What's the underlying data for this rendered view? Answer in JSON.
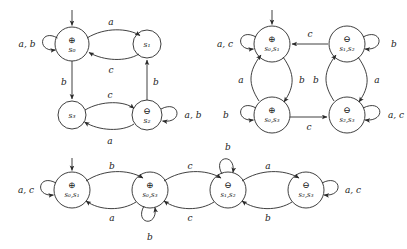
{
  "figure": {
    "type": "finite-automata-diagrams",
    "count": 3,
    "background": "#ffffff",
    "stroke": "#2a2a2a",
    "text_color": "#1a1a1a"
  },
  "symbols": {
    "accepting": "⊕",
    "rejecting": "⊖",
    "start_marker": "arrow"
  },
  "diagrams": [
    {
      "id": "dfa-1",
      "name": "automaton-top-left",
      "states": [
        {
          "id": "s0",
          "label": "s",
          "sub": "0",
          "mark": "⊕",
          "start": true,
          "cx": 72,
          "cy": 44,
          "r": 17
        },
        {
          "id": "s1",
          "label": "s",
          "sub": "1",
          "mark": "",
          "start": false,
          "cx": 147,
          "cy": 44,
          "r": 14
        },
        {
          "id": "s3",
          "label": "s",
          "sub": "3",
          "mark": "",
          "start": false,
          "cx": 72,
          "cy": 115,
          "r": 14
        },
        {
          "id": "s2",
          "label": "s",
          "sub": "2",
          "mark": "⊖",
          "start": false,
          "cx": 147,
          "cy": 115,
          "r": 15
        }
      ],
      "transitions": [
        {
          "from": "s0",
          "to": "s0",
          "label": "a, b",
          "kind": "self-left"
        },
        {
          "from": "s0",
          "to": "s1",
          "label": "a",
          "kind": "arc-top"
        },
        {
          "from": "s1",
          "to": "s0",
          "label": "c",
          "kind": "arc-bottom"
        },
        {
          "from": "s0",
          "to": "s3",
          "label": "b",
          "kind": "line-down-left"
        },
        {
          "from": "s2",
          "to": "s1",
          "label": "b",
          "kind": "line-up-right"
        },
        {
          "from": "s3",
          "to": "s2",
          "label": "c",
          "kind": "arc-top"
        },
        {
          "from": "s2",
          "to": "s3",
          "label": "a",
          "kind": "arc-bottom"
        },
        {
          "from": "s2",
          "to": "s2",
          "label": "a, b",
          "kind": "self-right"
        }
      ]
    },
    {
      "id": "dfa-2",
      "name": "automaton-top-right",
      "states": [
        {
          "id": "s0s1",
          "label": "s",
          "sub": "0",
          "label2": "s",
          "sub2": "1",
          "mark": "⊕",
          "start": true,
          "cx": 272,
          "cy": 44,
          "r": 18
        },
        {
          "id": "s1s2",
          "label": "s",
          "sub": "1",
          "label2": "s",
          "sub2": "2",
          "mark": "⊖",
          "start": false,
          "cx": 347,
          "cy": 44,
          "r": 18
        },
        {
          "id": "s0s3",
          "label": "s",
          "sub": "0",
          "label2": "s",
          "sub2": "3",
          "mark": "⊕",
          "start": false,
          "cx": 272,
          "cy": 115,
          "r": 18
        },
        {
          "id": "s2s3",
          "label": "s",
          "sub": "2",
          "label2": "s",
          "sub2": "3",
          "mark": "⊖",
          "start": false,
          "cx": 347,
          "cy": 115,
          "r": 18
        }
      ],
      "transitions": [
        {
          "from": "s0s1",
          "to": "s0s1",
          "label": "a, c",
          "kind": "self-left"
        },
        {
          "from": "s1s2",
          "to": "s0s1",
          "label": "c",
          "kind": "line-left"
        },
        {
          "from": "s1s2",
          "to": "s1s2",
          "label": "b",
          "kind": "self-right"
        },
        {
          "from": "s0s3",
          "to": "s0s1",
          "label": "a",
          "kind": "arc-left-up"
        },
        {
          "from": "s0s1",
          "to": "s0s3",
          "label": "b",
          "kind": "arc-right-down"
        },
        {
          "from": "s1s2",
          "to": "s2s3",
          "label": "a",
          "kind": "arc-right-down"
        },
        {
          "from": "s2s3",
          "to": "s1s2",
          "label": "b",
          "kind": "arc-left-up"
        },
        {
          "from": "s0s3",
          "to": "s0s3",
          "label": "b",
          "kind": "self-left"
        },
        {
          "from": "s0s3",
          "to": "s2s3",
          "label": "c",
          "kind": "line-right"
        },
        {
          "from": "s2s3",
          "to": "s2s3",
          "label": "a, c",
          "kind": "self-right"
        }
      ]
    },
    {
      "id": "dfa-3",
      "name": "automaton-bottom",
      "states": [
        {
          "id": "s0s1",
          "label": "s",
          "sub": "0",
          "label2": "s",
          "sub2": "1",
          "mark": "⊕",
          "start": true,
          "cx": 72,
          "cy": 190,
          "r": 18
        },
        {
          "id": "s0s3",
          "label": "s",
          "sub": "0",
          "label2": "s",
          "sub2": "3",
          "mark": "⊕",
          "start": false,
          "cx": 150,
          "cy": 190,
          "r": 18
        },
        {
          "id": "s1s2",
          "label": "s",
          "sub": "1",
          "label2": "s",
          "sub2": "2",
          "mark": "⊖",
          "start": false,
          "cx": 228,
          "cy": 190,
          "r": 18
        },
        {
          "id": "s2s3",
          "label": "s",
          "sub": "2",
          "label2": "s",
          "sub2": "3",
          "mark": "⊖",
          "start": false,
          "cx": 306,
          "cy": 190,
          "r": 18
        }
      ],
      "transitions": [
        {
          "from": "s0s1",
          "to": "s0s1",
          "label": "a, c",
          "kind": "self-left"
        },
        {
          "from": "s0s1",
          "to": "s0s3",
          "label": "b",
          "kind": "arc-top"
        },
        {
          "from": "s0s3",
          "to": "s0s1",
          "label": "a",
          "kind": "arc-bottom"
        },
        {
          "from": "s0s3",
          "to": "s0s3",
          "label": "b",
          "kind": "self-below"
        },
        {
          "from": "s0s3",
          "to": "s1s2",
          "label": "c",
          "kind": "arc-top"
        },
        {
          "from": "s1s2",
          "to": "s0s3",
          "label": "c",
          "kind": "arc-bottom"
        },
        {
          "from": "s1s2",
          "to": "s1s2",
          "label": "b",
          "kind": "self-above"
        },
        {
          "from": "s1s2",
          "to": "s2s3",
          "label": "a",
          "kind": "arc-top"
        },
        {
          "from": "s2s3",
          "to": "s1s2",
          "label": "b",
          "kind": "arc-bottom"
        },
        {
          "from": "s2s3",
          "to": "s2s3",
          "label": "a, c",
          "kind": "self-right"
        }
      ]
    }
  ],
  "edge_labels": {
    "d1": {
      "s0_self": "a, b",
      "s0_s1": "a",
      "s1_s0": "c",
      "s0_s3": "b",
      "s2_s1": "b",
      "s3_s2": "c",
      "s2_s3": "a",
      "s2_self": "a, b"
    },
    "d2": {
      "left_self": "a, c",
      "top_back": "c",
      "right_self": "b",
      "left_up": "a",
      "left_down": "b",
      "right_down": "a",
      "right_up": "b",
      "bl_self": "b",
      "bottom_right": "c",
      "br_self": "a, c"
    },
    "d3": {
      "n1_self": "a, c",
      "n1_n2": "b",
      "n2_n1": "a",
      "n2_self": "b",
      "n2_n3": "c",
      "n3_n2": "c",
      "n3_self": "b",
      "n3_n4": "a",
      "n4_n3": "b",
      "n4_self": "a, c"
    }
  },
  "state_text": {
    "d1": {
      "s0": "s₀",
      "s1": "s₁",
      "s2": "s₂",
      "s3": "s₃"
    },
    "d2": {
      "tl": "s₀,s₁",
      "tr": "s₁,s₂",
      "bl": "s₀,s₃",
      "br": "s₂,s₃"
    },
    "d3": {
      "n1": "s₀,s₁",
      "n2": "s₀,s₃",
      "n3": "s₁,s₂",
      "n4": "s₂,s₃"
    }
  },
  "marks": {
    "d1": {
      "s0": "⊕",
      "s2": "⊖"
    },
    "d2": {
      "tl": "⊕",
      "tr": "⊖",
      "bl": "⊕",
      "br": "⊖"
    },
    "d3": {
      "n1": "⊕",
      "n2": "⊕",
      "n3": "⊖",
      "n4": "⊖"
    }
  }
}
